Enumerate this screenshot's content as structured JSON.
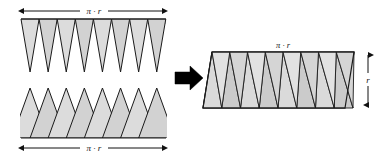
{
  "figure": {
    "background_color": "#ffffff",
    "labels": {
      "top_strip_width": "π · r",
      "bottom_strip_width": "π · r",
      "parallelogram_width": "π · r",
      "parallelogram_height": "r"
    },
    "colors": {
      "fill_light": "#dddddd",
      "fill_medium": "#d0d0d0",
      "fill_dark": "#c6c6c6",
      "stroke": "#1a1a1a",
      "arrow": "#000000",
      "dimension_line": "#111111"
    },
    "left_panel": {
      "name": "separated-sectors",
      "top_strip": {
        "name": "top-wedge-strip",
        "orientation": "points-down",
        "triangle_count": 8,
        "x_start": 21,
        "x_end": 166,
        "y_top": 19,
        "y_tip": 72
      },
      "bottom_strip": {
        "name": "bottom-wedge-strip",
        "orientation": "points-up",
        "triangle_count": 8,
        "x_start": 21,
        "x_end": 166,
        "y_apex": 88,
        "y_base": 138
      },
      "top_dimension": {
        "y": 11,
        "x_start": 21,
        "x_end": 166,
        "label": "π · r"
      },
      "bottom_dimension": {
        "y": 148,
        "x_start": 21,
        "x_end": 166,
        "label": "π · r"
      }
    },
    "transform_arrow": {
      "name": "transform-arrow",
      "direction": "right",
      "x": 175,
      "y": 78
    },
    "right_panel": {
      "name": "assembled-parallelogram",
      "triangle_count": 16,
      "x_left_bottom": 203,
      "x_left_top": 212,
      "x_right_bottom": 345,
      "x_right_top": 354,
      "y_top": 52,
      "y_bottom": 108,
      "width_dimension": {
        "label": "π · r",
        "x": 283,
        "y": 45
      },
      "height_dimension": {
        "label": "r",
        "x": 368,
        "y_top": 53,
        "y_bottom": 108
      }
    }
  }
}
